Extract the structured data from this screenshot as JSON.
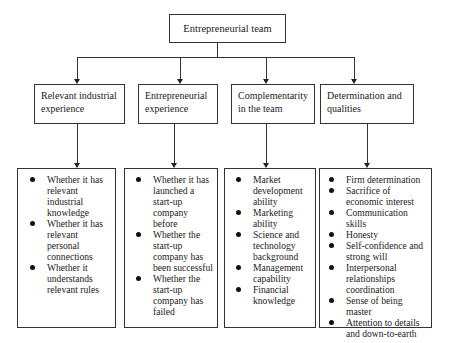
{
  "diagram": {
    "type": "tree",
    "root": {
      "label": "Entrepreneurial team"
    },
    "categories": [
      {
        "label": "Relevant industrial experience",
        "items": [
          "Whether it has relevant industrial knowledge",
          "Whether it has relevant personal connections",
          "Whether it understands relevant rules"
        ]
      },
      {
        "label": "Entrepreneurial experience",
        "items": [
          "Whether it has launched a start-up company before",
          "Whether the start-up company has been successful",
          "Whether the start-up company has failed"
        ]
      },
      {
        "label": "Complementarity in the team",
        "items": [
          "Market development ability",
          "Marketing ability",
          "Science and technology background",
          "Management capability",
          "Financial knowledge"
        ]
      },
      {
        "label": "Determination and qualities",
        "items": [
          "Firm determination",
          "Sacrifice of economic interest",
          "Communication skills",
          "Honesty",
          "Self-confidence and strong will",
          "Interpersonal relationships coordination",
          "Sense of being master",
          "Attention to details and down-to-earth"
        ]
      }
    ]
  }
}
